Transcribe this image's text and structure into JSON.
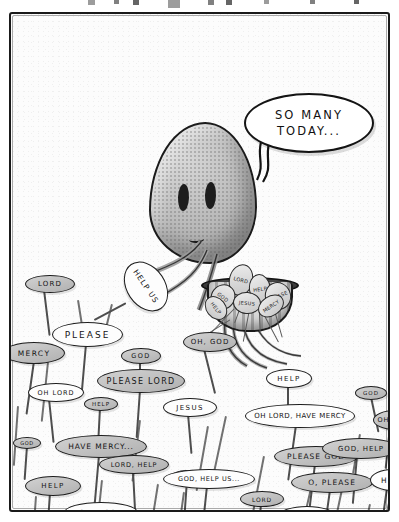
{
  "artwork": {
    "title": "So Many Today",
    "type": "single-panel cartoon",
    "medium": "pencil and ink drawing, grayscale",
    "paper_color": "#fcfcfc",
    "ink_color": "#1a1a1a",
    "creature_color": "#b9b9b9"
  },
  "top_marks": [
    {
      "x": 88,
      "w": 7,
      "h": 5
    },
    {
      "x": 114,
      "w": 5,
      "h": 4
    },
    {
      "x": 133,
      "w": 6,
      "h": 5
    },
    {
      "x": 168,
      "w": 12,
      "h": 8
    },
    {
      "x": 208,
      "w": 6,
      "h": 5
    },
    {
      "x": 226,
      "w": 6,
      "h": 5
    },
    {
      "x": 264,
      "w": 5,
      "h": 4
    },
    {
      "x": 310,
      "w": 5,
      "h": 4
    },
    {
      "x": 354,
      "w": 5,
      "h": 4
    }
  ],
  "speech_balloon": {
    "line1": "SO MANY",
    "line2": "TODAY...",
    "speaker": "octopus-creature"
  },
  "creature": {
    "name": "octopus-creature",
    "eyes": 2,
    "holding": "harvested prayer signs in a basket"
  },
  "basket": {
    "label": "harvest-basket",
    "harvested_signs": [
      {
        "text": "LORD",
        "x": 22,
        "y": 2,
        "w": 22,
        "h": 30,
        "rot": 14
      },
      {
        "text": "HELP",
        "x": 42,
        "y": 12,
        "w": 20,
        "h": 28,
        "rot": -8
      },
      {
        "text": "GOD",
        "x": 4,
        "y": 22,
        "w": 22,
        "h": 24,
        "rot": 38
      },
      {
        "text": "PLEASE",
        "x": 58,
        "y": 20,
        "w": 24,
        "h": 26,
        "rot": -22
      },
      {
        "text": "JESUS",
        "x": 26,
        "y": 30,
        "w": 26,
        "h": 20,
        "rot": 5
      },
      {
        "text": "HELP",
        "x": -4,
        "y": 36,
        "w": 24,
        "h": 18,
        "rot": 52
      },
      {
        "text": "MERCY",
        "x": 50,
        "y": 34,
        "w": 26,
        "h": 18,
        "rot": -34
      }
    ]
  },
  "prayer_signs": [
    {
      "text": "LORD",
      "x": 14,
      "y": 261,
      "w": 50,
      "h": 18,
      "fs": 7,
      "ls": 1.2,
      "tone": "gray",
      "stick_h": 46,
      "stick_rot": -7,
      "stick_x": 18
    },
    {
      "text": "HELP US",
      "x": 108,
      "y": 253,
      "w": 54,
      "h": 39,
      "fs": 7.5,
      "ls": 1.0,
      "tone": "white",
      "stick_h": 36,
      "stick_rot": 62,
      "stick_x": 6,
      "rot": 56
    },
    {
      "text": "PLEASE",
      "x": 41,
      "y": 308,
      "w": 71,
      "h": 25,
      "fs": 9,
      "ls": 2.0,
      "tone": "white",
      "stick_h": 50,
      "stick_rot": 5,
      "stick_x": 33
    },
    {
      "text": "MERCY",
      "x": -8,
      "y": 328,
      "w": 62,
      "h": 22,
      "fs": 7.5,
      "ls": 1.4,
      "tone": "gray",
      "stick_h": 54,
      "stick_rot": 8,
      "stick_x": 30
    },
    {
      "text": "GOD",
      "x": 110,
      "y": 334,
      "w": 40,
      "h": 16,
      "fs": 6.5,
      "ls": 1.4,
      "tone": "gray",
      "stick_h": 24,
      "stick_rot": 0,
      "stick_x": 18
    },
    {
      "text": "OH, GOD",
      "x": 172,
      "y": 318,
      "w": 54,
      "h": 20,
      "fs": 7,
      "ls": 1.0,
      "tone": "gray",
      "stick_h": 46,
      "stick_rot": -14,
      "stick_x": 20
    },
    {
      "text": "OH LORD",
      "x": 17,
      "y": 369,
      "w": 56,
      "h": 19,
      "fs": 6.5,
      "ls": 1.0,
      "tone": "white",
      "stick_h": 44,
      "stick_rot": -6,
      "stick_x": 20
    },
    {
      "text": "PLEASE LORD",
      "x": 86,
      "y": 355,
      "w": 88,
      "h": 24,
      "fs": 8,
      "ls": 1.3,
      "tone": "gray",
      "stick_h": 48,
      "stick_rot": 4,
      "stick_x": 42
    },
    {
      "text": "HELP",
      "x": 255,
      "y": 355,
      "w": 46,
      "h": 19,
      "fs": 7,
      "ls": 1.4,
      "tone": "white",
      "stick_h": 30,
      "stick_rot": 0,
      "stick_x": 21
    },
    {
      "text": "GOD",
      "x": 344,
      "y": 372,
      "w": 32,
      "h": 14,
      "fs": 5.5,
      "ls": 1.0,
      "tone": "gray",
      "stick_h": 36,
      "stick_rot": -12,
      "stick_x": 15
    },
    {
      "text": "HELP",
      "x": 73,
      "y": 383,
      "w": 34,
      "h": 14,
      "fs": 5.5,
      "ls": 1.0,
      "tone": "gray",
      "stick_h": 30,
      "stick_rot": 3,
      "stick_x": 15
    },
    {
      "text": "JESUS",
      "x": 152,
      "y": 384,
      "w": 54,
      "h": 19,
      "fs": 7,
      "ls": 1.4,
      "tone": "white",
      "stick_h": 40,
      "stick_rot": -5,
      "stick_x": 24
    },
    {
      "text": "OH LORD, HAVE MERCY",
      "x": 234,
      "y": 390,
      "w": 110,
      "h": 24,
      "fs": 7,
      "ls": 0.5,
      "tone": "white",
      "stick_h": 56,
      "stick_rot": 8,
      "stick_x": 50
    },
    {
      "text": "OH, GOD",
      "x": 362,
      "y": 396,
      "w": 44,
      "h": 20,
      "fs": 6.5,
      "ls": 0.8,
      "tone": "gray",
      "stick_h": 42,
      "stick_rot": 6,
      "stick_x": 16
    },
    {
      "text": "GOD",
      "x": 2,
      "y": 423,
      "w": 28,
      "h": 12,
      "fs": 5,
      "ls": 0.6,
      "tone": "gray",
      "stick_h": 34,
      "stick_rot": 4,
      "stick_x": 13
    },
    {
      "text": "HAVE MERCY...",
      "x": 44,
      "y": 421,
      "w": 92,
      "h": 23,
      "fs": 7.5,
      "ls": 0.9,
      "tone": "gray",
      "stick_h": 62,
      "stick_rot": 5,
      "stick_x": 43
    },
    {
      "text": "LORD, HELP",
      "x": 88,
      "y": 441,
      "w": 70,
      "h": 19,
      "fs": 6.5,
      "ls": 0.8,
      "tone": "gray",
      "stick_h": 48,
      "stick_rot": -3,
      "stick_x": 33
    },
    {
      "text": "PLEASE GOD",
      "x": 263,
      "y": 432,
      "w": 84,
      "h": 21,
      "fs": 7.5,
      "ls": 1.0,
      "tone": "gray",
      "stick_h": 52,
      "stick_rot": 7,
      "stick_x": 40
    },
    {
      "text": "HELP",
      "x": 160,
      "y": 456,
      "w": 32,
      "h": 13,
      "fs": 5,
      "ls": 0.6,
      "tone": "gray",
      "stick_h": 40,
      "stick_rot": 4,
      "stick_x": 15
    },
    {
      "text": "GOD, HELP US...",
      "x": 152,
      "y": 455,
      "w": 92,
      "h": 20,
      "fs": 6.5,
      "ls": 0.6,
      "tone": "white",
      "stick_h": 48,
      "stick_rot": 6,
      "stick_x": 43
    },
    {
      "text": "GOD, HELP",
      "x": 311,
      "y": 424,
      "w": 78,
      "h": 21,
      "fs": 7,
      "ls": 0.8,
      "tone": "gray",
      "stick_h": 48,
      "stick_rot": 5,
      "stick_x": 34
    },
    {
      "text": "HELP",
      "x": 14,
      "y": 462,
      "w": 56,
      "h": 20,
      "fs": 7,
      "ls": 1.4,
      "tone": "gray",
      "stick_h": 40,
      "stick_rot": 4,
      "stick_x": 24
    },
    {
      "text": "O, PLEASE",
      "x": 280,
      "y": 458,
      "w": 82,
      "h": 21,
      "fs": 7.5,
      "ls": 1.0,
      "tone": "gray",
      "stick_h": 42,
      "stick_rot": 8,
      "stick_x": 38
    },
    {
      "text": "HELP",
      "x": 359,
      "y": 455,
      "w": 46,
      "h": 22,
      "fs": 7.5,
      "ls": 1.2,
      "tone": "white",
      "stick_h": 44,
      "stick_rot": 8,
      "stick_x": 16
    },
    {
      "text": "LORD",
      "x": 229,
      "y": 477,
      "w": 44,
      "h": 16,
      "fs": 6,
      "ls": 0.8,
      "tone": "gray",
      "stick_h": 30,
      "stick_rot": 5,
      "stick_x": 20
    },
    {
      "text": "OH... GOD",
      "x": 53,
      "y": 488,
      "w": 74,
      "h": 21,
      "fs": 7,
      "ls": 0.9,
      "tone": "white",
      "stick_h": 26,
      "stick_rot": 4,
      "stick_x": 34
    },
    {
      "text": "JESUS",
      "x": 268,
      "y": 492,
      "w": 56,
      "h": 19,
      "fs": 6.5,
      "ls": 1.2,
      "tone": "white",
      "stick_h": 24,
      "stick_rot": 5,
      "stick_x": 26
    }
  ],
  "bare_stalks": [
    {
      "x": 6,
      "y": 392,
      "h": 60,
      "rot": 4
    },
    {
      "x": 36,
      "y": 348,
      "h": 60,
      "rot": 6
    },
    {
      "x": 66,
      "y": 286,
      "h": 42,
      "rot": -9
    },
    {
      "x": 100,
      "y": 290,
      "h": 40,
      "rot": 14
    },
    {
      "x": 128,
      "y": 406,
      "h": 62,
      "rot": 7
    },
    {
      "x": 196,
      "y": 412,
      "h": 66,
      "rot": 10
    },
    {
      "x": 214,
      "y": 402,
      "h": 72,
      "rot": 12
    },
    {
      "x": 252,
      "y": 442,
      "h": 56,
      "rot": 11
    },
    {
      "x": 300,
      "y": 470,
      "h": 44,
      "rot": 13
    },
    {
      "x": 332,
      "y": 466,
      "h": 46,
      "rot": 12
    },
    {
      "x": 358,
      "y": 490,
      "h": 30,
      "rot": 12
    },
    {
      "x": 380,
      "y": 476,
      "h": 40,
      "rot": 13
    },
    {
      "x": 90,
      "y": 466,
      "h": 42,
      "rot": 6
    },
    {
      "x": 172,
      "y": 478,
      "h": 40,
      "rot": 8
    },
    {
      "x": 24,
      "y": 482,
      "h": 32,
      "rot": 4
    },
    {
      "x": 146,
      "y": 470,
      "h": 46,
      "rot": 9
    },
    {
      "x": 348,
      "y": 420,
      "h": 40,
      "rot": 10
    }
  ]
}
